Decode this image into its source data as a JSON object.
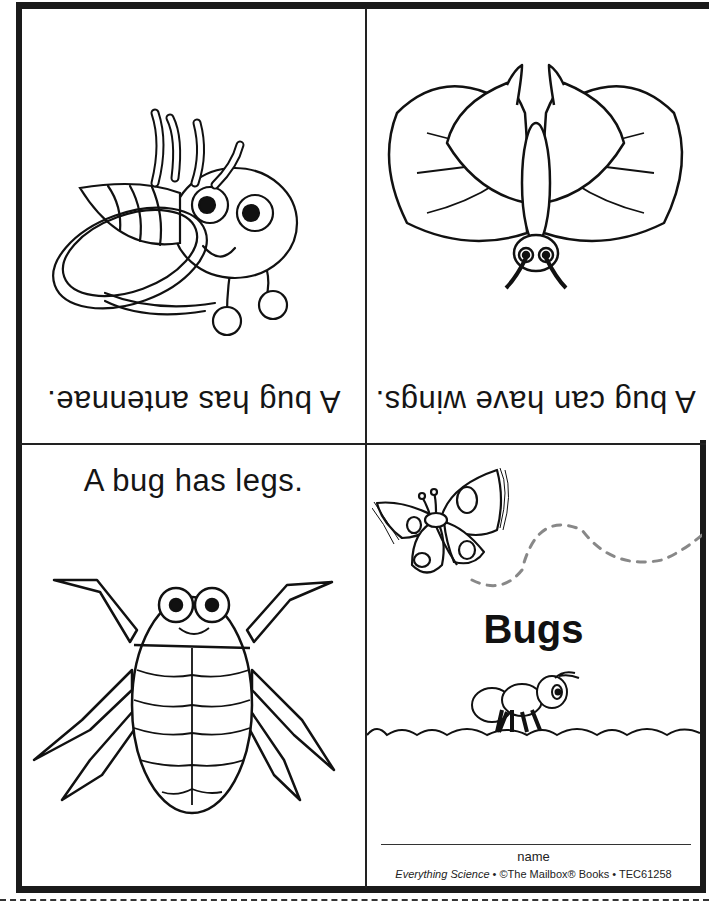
{
  "document": {
    "type": "mini-booklet",
    "colors": {
      "ink": "#111111",
      "dash": "#888888",
      "background": "#ffffff"
    }
  },
  "panels": {
    "top_left": {
      "caption": "A bug has antennae.",
      "orientation": "upside-down",
      "illustration": "fly-icon"
    },
    "top_right": {
      "caption": "A bug can have wings.",
      "orientation": "upside-down",
      "illustration": "butterfly-icon"
    },
    "bottom_left": {
      "caption": "A bug has legs.",
      "orientation": "upright",
      "illustration": "beetle-icon"
    },
    "bottom_right": {
      "title": "Bugs",
      "name_label": "name",
      "credit": {
        "series": "Everything Science",
        "sep1": " • ",
        "publisher": "©The Mailbox® Books",
        "sep2": " • ",
        "code": "TEC61258"
      },
      "illustrations": [
        "butterfly-icon",
        "flight-path-icon",
        "ant-icon",
        "grass-icon"
      ]
    }
  },
  "cut_line": {
    "style": "dashed"
  }
}
